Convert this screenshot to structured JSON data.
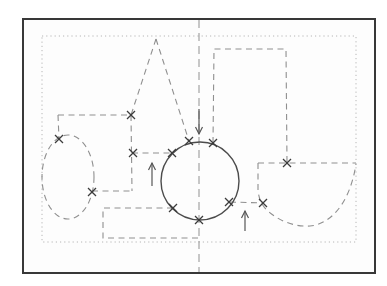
{
  "figure": {
    "canvas": {
      "width": 387,
      "height": 286
    },
    "colors": {
      "background": "#ffffff",
      "canvas_fill": "#fdfdfd",
      "frame": "#383838",
      "dotted": "#b6b6b6",
      "centerline": "#9c9c9c",
      "dashed": "#8f8f8f",
      "solid": "#4c4c4c",
      "marker": "#3c3c3c",
      "arrow": "#565656"
    },
    "dash_patterns": {
      "dotted": "1.2 3",
      "dashed": "6 4.5",
      "centerline": "8 5"
    },
    "elements": [
      {
        "type": "rect",
        "name": "outer-frame",
        "x": 23,
        "y": 19,
        "w": 352,
        "h": 254,
        "stroke": "frame",
        "sw": 2,
        "fill": "canvas_fill"
      },
      {
        "type": "rect",
        "name": "inner-dotted-boundary",
        "x": 42,
        "y": 36,
        "w": 314,
        "h": 206,
        "stroke": "dotted",
        "sw": 1,
        "dash": "dotted"
      },
      {
        "type": "line",
        "name": "vertical-centerline",
        "x1": 199,
        "y1": 20,
        "x2": 199,
        "y2": 272,
        "stroke": "centerline",
        "sw": 1.1,
        "dash": "centerline"
      },
      {
        "type": "line",
        "name": "triangle-left-leg",
        "x1": 156,
        "y1": 39,
        "x2": 131,
        "y2": 115,
        "stroke": "dashed",
        "sw": 1.1,
        "dash": "dashed"
      },
      {
        "type": "line",
        "name": "triangle-right-leg",
        "x1": 156,
        "y1": 39,
        "x2": 189,
        "y2": 141,
        "stroke": "dashed",
        "sw": 1.1,
        "dash": "dashed"
      },
      {
        "type": "line",
        "name": "left-step-horizontal",
        "x1": 58,
        "y1": 115,
        "x2": 131,
        "y2": 115,
        "stroke": "dashed",
        "sw": 1.1,
        "dash": "dashed"
      },
      {
        "type": "line",
        "name": "ellipse-drop-line",
        "x1": 58,
        "y1": 115,
        "x2": 59,
        "y2": 139,
        "stroke": "dashed",
        "sw": 1.1,
        "dash": "dashed"
      },
      {
        "type": "line",
        "name": "step-vertical-line",
        "x1": 131,
        "y1": 115,
        "x2": 132,
        "y2": 191,
        "stroke": "dashed",
        "sw": 1.1,
        "dash": "dashed"
      },
      {
        "type": "line",
        "name": "circle-left-connector",
        "x1": 132,
        "y1": 153,
        "x2": 171,
        "y2": 153,
        "stroke": "dashed",
        "sw": 1.1,
        "dash": "dashed"
      },
      {
        "type": "line",
        "name": "ellipse-right-connector",
        "x1": 92,
        "y1": 191,
        "x2": 132,
        "y2": 191,
        "stroke": "dashed",
        "sw": 1.1,
        "dash": "dashed"
      },
      {
        "type": "polyline",
        "name": "bottom-rectangle-path",
        "points": "173,208 103,208 103,238 198,238",
        "stroke": "dashed",
        "sw": 1.1,
        "dash": "dashed"
      },
      {
        "type": "polyline",
        "name": "tall-rectangle-path",
        "points": "213,143 214,49 286,49 287,163",
        "stroke": "dashed",
        "sw": 1.1,
        "dash": "dashed"
      },
      {
        "type": "line",
        "name": "cup-top-edge",
        "x1": 258,
        "y1": 163,
        "x2": 356,
        "y2": 163,
        "stroke": "dashed",
        "sw": 1.1,
        "dash": "dashed"
      },
      {
        "type": "path",
        "name": "cup-body-arc",
        "d": "M258,163 L258,190 C259,201 263,207 269,212 C281,222 296,227 310,226 C331,224 350,203 356,164",
        "stroke": "dashed",
        "sw": 1.1,
        "dash": "dashed"
      },
      {
        "type": "line",
        "name": "circle-cup-connector",
        "x1": 230,
        "y1": 202,
        "x2": 263,
        "y2": 203,
        "stroke": "dashed",
        "sw": 1.1,
        "dash": "dashed"
      },
      {
        "type": "ellipse",
        "name": "dashed-ellipse",
        "cx": 68,
        "cy": 177,
        "rx": 26,
        "ry": 42,
        "stroke": "dashed",
        "sw": 1.1,
        "dash": "dashed"
      },
      {
        "type": "circle",
        "name": "solid-circle",
        "cx": 200,
        "cy": 181,
        "r": 39,
        "stroke": "solid",
        "sw": 1.4
      },
      {
        "type": "xmark",
        "name": "marker-step-top",
        "x": 131,
        "y": 115,
        "size": 4
      },
      {
        "type": "xmark",
        "name": "marker-ellipse-top",
        "x": 59,
        "y": 139,
        "size": 4
      },
      {
        "type": "xmark",
        "name": "marker-ellipse-right",
        "x": 92,
        "y": 192,
        "size": 4
      },
      {
        "type": "xmark",
        "name": "marker-step-mid",
        "x": 133,
        "y": 153,
        "size": 4
      },
      {
        "type": "xmark",
        "name": "marker-circle-left",
        "x": 172,
        "y": 153,
        "size": 4
      },
      {
        "type": "xmark",
        "name": "marker-circle-top-left",
        "x": 189,
        "y": 141,
        "size": 4
      },
      {
        "type": "xmark",
        "name": "marker-circle-top-right",
        "x": 213,
        "y": 143,
        "size": 4
      },
      {
        "type": "xmark",
        "name": "marker-circle-bottom-left",
        "x": 173,
        "y": 208,
        "size": 4
      },
      {
        "type": "xmark",
        "name": "marker-circle-bottom",
        "x": 199,
        "y": 220,
        "size": 4
      },
      {
        "type": "xmark",
        "name": "marker-circle-bottom-right",
        "x": 229,
        "y": 202,
        "size": 4
      },
      {
        "type": "xmark",
        "name": "marker-cup-left",
        "x": 263,
        "y": 203,
        "size": 4
      },
      {
        "type": "xmark",
        "name": "marker-cup-top",
        "x": 287,
        "y": 163,
        "size": 4
      },
      {
        "type": "arrow",
        "name": "down-arrow",
        "tip": [
          199,
          134
        ],
        "tail": [
          199,
          109
        ],
        "head": 7
      },
      {
        "type": "arrow",
        "name": "up-arrow-left",
        "tip": [
          152,
          163
        ],
        "tail": [
          152,
          186
        ],
        "head": 7
      },
      {
        "type": "arrow",
        "name": "up-arrow-right",
        "tip": [
          245,
          211
        ],
        "tail": [
          245,
          231
        ],
        "head": 7
      }
    ]
  }
}
